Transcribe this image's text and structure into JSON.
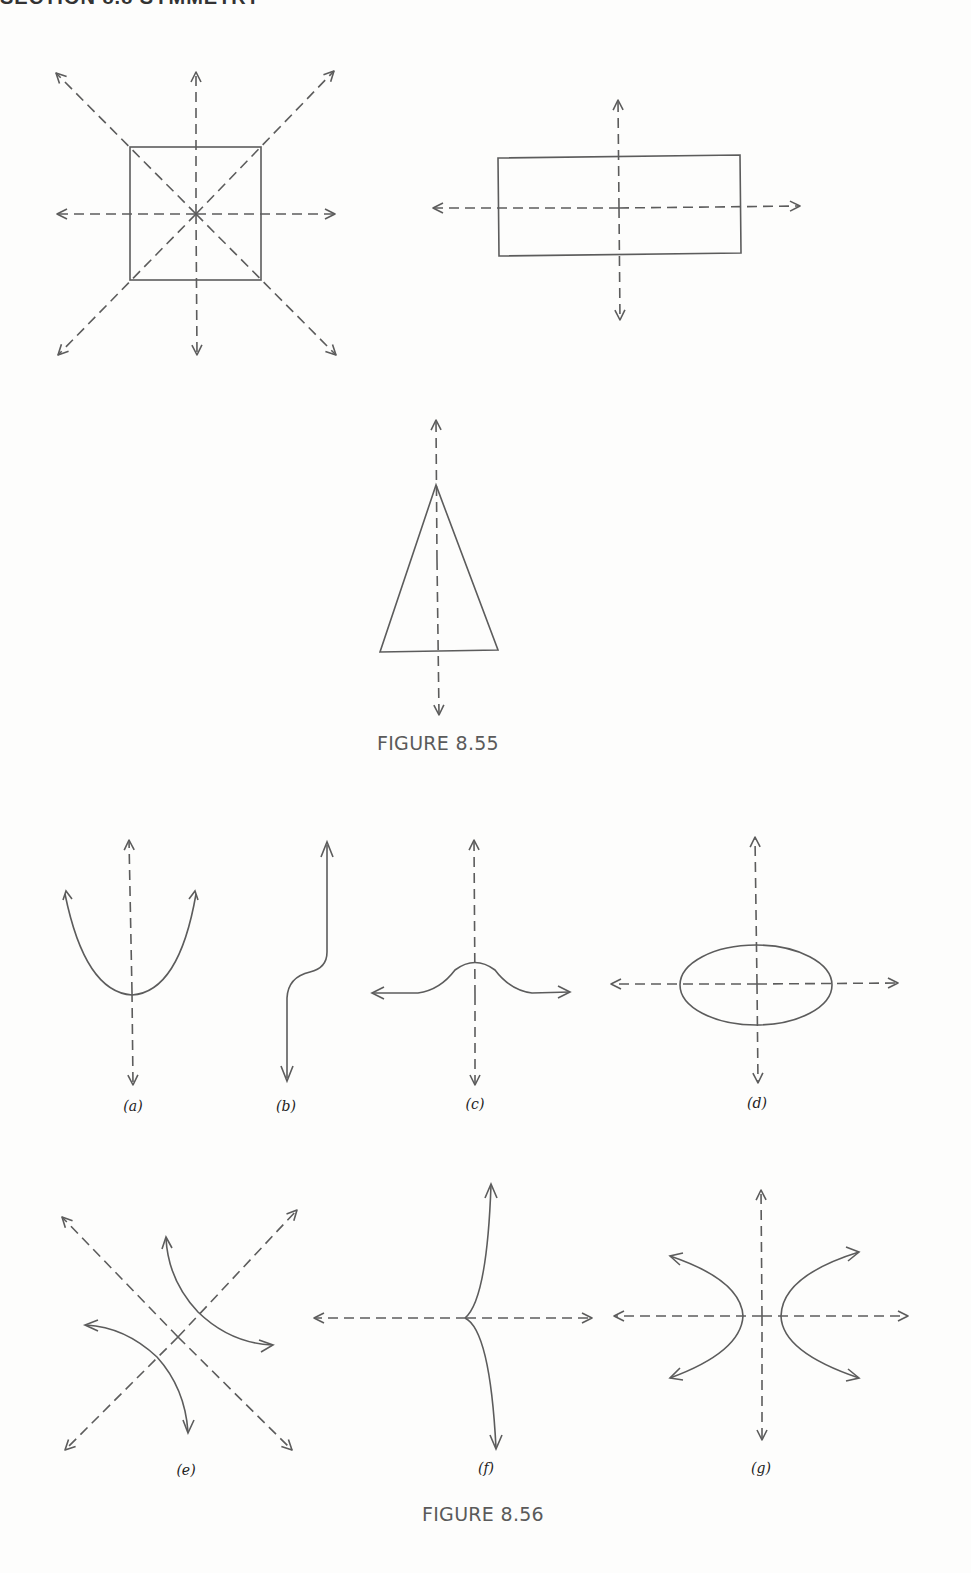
{
  "page": {
    "header_fragment": "SECTION 8.8 SYMMETRY",
    "stroke_color": "#5c5c5c",
    "label_color": "#222222",
    "caption_color": "#5a5a5a"
  },
  "figure_855": {
    "caption": "FIGURE 8.55",
    "shapes": [
      {
        "name": "square",
        "axes_of_symmetry": 4
      },
      {
        "name": "rectangle",
        "axes_of_symmetry": 2
      },
      {
        "name": "isosceles-triangle",
        "axes_of_symmetry": 1
      }
    ]
  },
  "figure_856": {
    "caption": "FIGURE 8.56",
    "panels": [
      {
        "id": "a",
        "label": "(a)",
        "curve": "parabola-opening-up",
        "axes": "vertical"
      },
      {
        "id": "b",
        "label": "(b)",
        "curve": "s-curve-step",
        "axes": "none"
      },
      {
        "id": "c",
        "label": "(c)",
        "curve": "bell-curve",
        "axes": "vertical"
      },
      {
        "id": "d",
        "label": "(d)",
        "curve": "ellipse",
        "axes": "horizontal-and-vertical"
      },
      {
        "id": "e",
        "label": "(e)",
        "curve": "rotated-hyperbola",
        "axes": "diagonal"
      },
      {
        "id": "f",
        "label": "(f)",
        "curve": "cusp",
        "axes": "horizontal"
      },
      {
        "id": "g",
        "label": "(g)",
        "curve": "hyperbola",
        "axes": "horizontal-and-vertical"
      }
    ]
  }
}
